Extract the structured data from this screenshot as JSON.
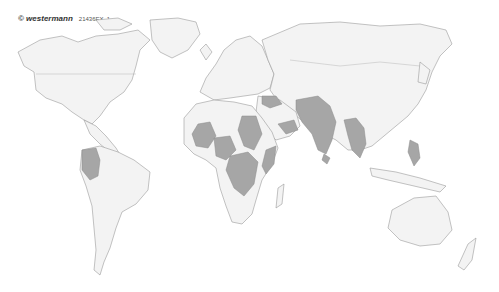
{
  "credit": {
    "brand": "© westermann",
    "code": "21436EX_1"
  },
  "map": {
    "type": "world map",
    "land_color": "#f3f3f3",
    "highlight_color": "#a6a6a6",
    "border_color": "#9a9a9a",
    "highlighted_regions": [
      "Colombia",
      "Mali",
      "Niger",
      "Nigeria",
      "Sudan",
      "South Sudan",
      "Central African Republic",
      "DR Congo",
      "Ethiopia",
      "Somalia",
      "Yemen",
      "Syria",
      "Iraq",
      "Afghanistan",
      "Pakistan",
      "India",
      "Sri Lanka",
      "Myanmar",
      "Thailand",
      "Philippines"
    ]
  }
}
